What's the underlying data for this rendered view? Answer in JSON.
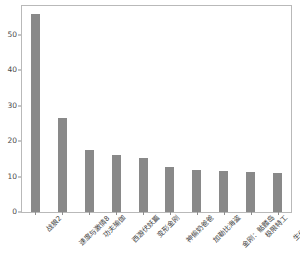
{
  "chart_data": {
    "type": "bar",
    "title": "",
    "subtitle": "",
    "xlabel": "",
    "ylabel": "",
    "categories": [
      "战狼2",
      "速度与激情8",
      "功夫瑜伽",
      "西游伏妖篇",
      "变形金刚",
      "神偷奶爸爸",
      "加勒比海盗",
      "金刚：骷髅岛",
      "极限特工",
      "生化危机6"
    ],
    "values": [
      56.0,
      26.5,
      17.5,
      16.2,
      15.3,
      12.7,
      11.8,
      11.6,
      11.2,
      11.0
    ],
    "ylim": [
      0,
      58.2
    ],
    "yticks": [
      0,
      10,
      20,
      30,
      40,
      50
    ],
    "ytick_labels": [
      "0",
      "10",
      "20",
      "30",
      "40",
      "50"
    ],
    "grid": false,
    "legend": null,
    "bar_color": "#898989",
    "frame_color": "#b9b9b9",
    "tick_color": "#8e8e8e",
    "label_color": "#3e3e3e",
    "background": "#ffffff",
    "xtick_rotation": -45
  }
}
